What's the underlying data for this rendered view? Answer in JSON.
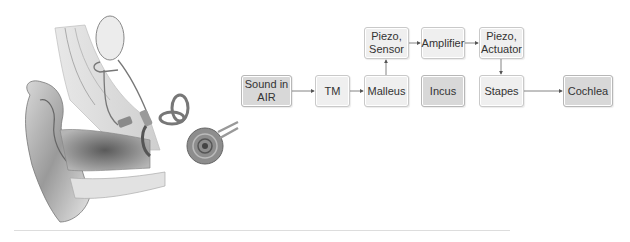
{
  "figure": {
    "illustration": "middle-ear-implant-anatomy",
    "colors": {
      "box_fill": "#efefef",
      "box_fill_dark": "#d8d8d8",
      "box_border": "#c9c9c9",
      "arrow": "#555555"
    }
  },
  "diagram": {
    "nodes": {
      "sound": "Sound in\nAIR",
      "tm": "TM",
      "malleus": "Malleus",
      "piezo_sensor": "Piezo,\nSensor",
      "amplifier": "Amplifier",
      "piezo_actuator": "Piezo,\nActuator",
      "incus": "Incus",
      "stapes": "Stapes",
      "cochlea": "Cochlea"
    },
    "edges": [
      [
        "sound",
        "tm"
      ],
      [
        "tm",
        "malleus"
      ],
      [
        "malleus",
        "piezo_sensor"
      ],
      [
        "piezo_sensor",
        "amplifier"
      ],
      [
        "amplifier",
        "piezo_actuator"
      ],
      [
        "piezo_actuator",
        "stapes"
      ],
      [
        "stapes",
        "cochlea"
      ]
    ]
  }
}
